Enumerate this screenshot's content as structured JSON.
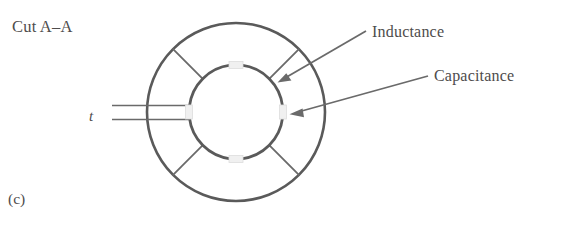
{
  "figure": {
    "cut_label": "Cut A–A",
    "caption": "(c)",
    "thickness_label": "t",
    "annotations": [
      {
        "name": "inductance",
        "text": "Inductance"
      },
      {
        "name": "capacitance",
        "text": "Capacitance"
      }
    ],
    "colors": {
      "stroke": "#5a5a5a",
      "stroke_light": "#6e6e6e",
      "text": "#4e4c4c",
      "background": "#ffffff",
      "gap_fill": "#f2f2f2"
    },
    "geometry": {
      "center_x": 236,
      "center_y": 112,
      "outer_radius": 89,
      "inner_radius": 47,
      "spoke_angles_deg": [
        45,
        135,
        225,
        315
      ],
      "thickness_spoke_angle_deg": 180,
      "gap_angles_deg": [
        0,
        90,
        180,
        270
      ]
    }
  }
}
